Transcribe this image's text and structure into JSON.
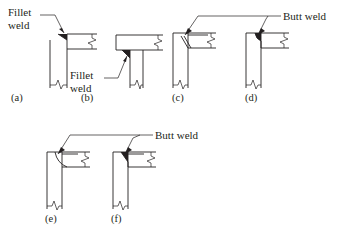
{
  "figure": {
    "background_color": "#ffffff",
    "line_color": "#231f20",
    "width": 339,
    "height": 231
  },
  "annotations": {
    "fillet_weld_a_line1": "Fillet",
    "fillet_weld_a_line2": "weld",
    "fillet_weld_b_line1": "Fillet",
    "fillet_weld_b_line2": "weld",
    "butt_weld_top": "Butt weld",
    "butt_weld_bottom": "Butt weld"
  },
  "details": [
    {
      "id": "a",
      "caption": "(a)",
      "weld_type": "Fillet weld",
      "description": "Beam seated on top of column with fillet weld at beam-to-column top junction"
    },
    {
      "id": "b",
      "caption": "(b)",
      "weld_type": "Fillet weld",
      "description": "Beam bearing over narrow column with fillet weld at underside junction"
    },
    {
      "id": "c",
      "caption": "(c)",
      "weld_type": "Butt weld",
      "description": "Beam framing into column face with bevelled butt weld preparation"
    },
    {
      "id": "d",
      "caption": "(d)",
      "weld_type": "Butt weld",
      "description": "Beam framing into column face with small radiused butt weld"
    },
    {
      "id": "e",
      "caption": "(e)",
      "weld_type": "Butt weld",
      "description": "Beam to column corner with concave curved butt weld profile"
    },
    {
      "id": "f",
      "caption": "(f)",
      "weld_type": "Butt weld",
      "description": "Beam to column corner with filled triangular butt weld"
    }
  ]
}
